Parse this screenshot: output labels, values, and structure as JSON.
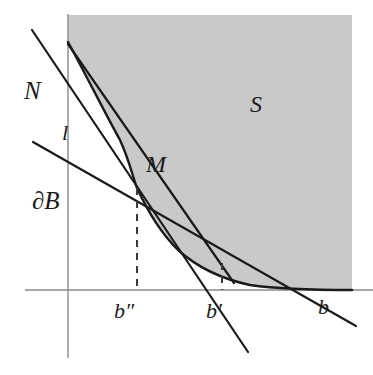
{
  "figure": {
    "type": "geometric-diagram",
    "caption_labels": {
      "normal_line": "N",
      "secant_line": "l",
      "boundary_curve": "∂B",
      "tangent_point": "M",
      "region": "S",
      "b_double_prime": "b″",
      "b_prime": "b′",
      "b": "b"
    },
    "colors": {
      "region_fill": "#c9c9c9",
      "curve_stroke": "#1a1a1a",
      "axis_stroke": "#8a8a8a",
      "dashed_stroke": "#3a3a3a",
      "background": "#ffffff"
    },
    "geometry": {
      "origin": {
        "x": 68,
        "y": 290
      },
      "x_axis": {
        "x1": 25,
        "y1": 290,
        "x2": 373,
        "y2": 290
      },
      "y_axis": {
        "x1": 68,
        "y1": 14,
        "x2": 68,
        "y2": 358
      },
      "region_right_edge": 352,
      "region_top_edge": 15,
      "curve_points": "68,42 80,62 93,85 106,110 120,140 137,188 152,215 168,238 186,256 205,270 225,280 248,285 275,288 300,289 352,290",
      "line_N": {
        "x1": 32,
        "y1": 30,
        "x2": 248,
        "y2": 352
      },
      "line_l": {
        "x1": 68,
        "y1": 44,
        "x2": 232,
        "y2": 280
      },
      "line_dB": {
        "x1": 33,
        "y1": 142,
        "x2": 356,
        "y2": 326
      },
      "dashed_b_double_prime": {
        "x": 137,
        "y1": 188,
        "y2": 290
      },
      "dashed_b_prime": {
        "x": 222,
        "y1": 263,
        "y2": 290
      }
    }
  }
}
